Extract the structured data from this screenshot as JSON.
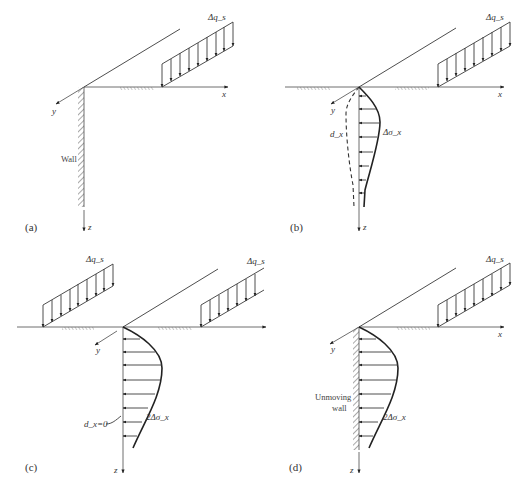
{
  "figure": {
    "panels": [
      {
        "id": "a",
        "label": "(a)",
        "load_label": "Δq_s",
        "axis_labels": {
          "x": "x",
          "y": "y",
          "z": "z"
        },
        "wall_label": "Wall",
        "description": "Strip load Δq_s at surface near a wall; x-y-z coordinate axes"
      },
      {
        "id": "b",
        "label": "(b)",
        "load_label": "Δq_s",
        "axis_labels": {
          "x": "x",
          "y": "y",
          "z": "z"
        },
        "stress_label": "Δσ_x",
        "displacement_label": "d_x",
        "description": "Horizontal stress distribution Δσ_x (solid) and lateral displacement d_x (dashed) without wall"
      },
      {
        "id": "c",
        "label": "(c)",
        "load_labels": [
          "Δq_s",
          "Δq_s"
        ],
        "axis_labels": {
          "x": "x",
          "y": "y",
          "z": "z"
        },
        "stress_label": "2Δσ_x",
        "displacement_label": "d_x=0",
        "description": "Symmetric image loading giving zero displacement on z axis; stress doubles to 2Δσ_x"
      },
      {
        "id": "d",
        "label": "(d)",
        "load_label": "Δq_s",
        "axis_labels": {
          "x": "x",
          "y": "y",
          "z": "z"
        },
        "stress_label": "2Δσ_x",
        "wall_label_line1": "Unmoving",
        "wall_label_line2": "wall",
        "description": "Unmoving wall receives stress 2Δσ_x"
      }
    ]
  }
}
